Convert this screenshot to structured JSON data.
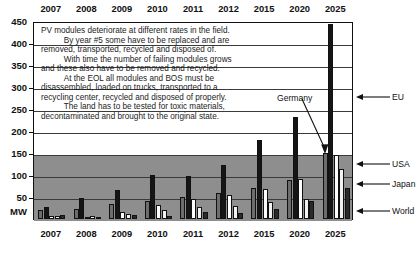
{
  "chart_data": {
    "type": "bar",
    "title": "",
    "xlabel": "",
    "ylabel": "MW",
    "ylim": [
      0,
      450
    ],
    "ytick_values": [
      450,
      400,
      350,
      300,
      250,
      200,
      150,
      100,
      50
    ],
    "ytick_labels": [
      "450",
      "400",
      "350",
      "300",
      "250",
      "200",
      "150",
      "100",
      "50"
    ],
    "origin_label": "MW",
    "grid": "horizontal gridlines at 50 MW intervals; shaded gray band from 0 to 150 MW",
    "legend_position": "right side with arrows pointing to 2025 bars; 'Germany' callout with arrow",
    "categories": [
      "2007",
      "2008",
      "2009",
      "2010",
      "2011",
      "2012",
      "2015",
      "2020",
      "2025"
    ],
    "series": [
      {
        "name": "Germany",
        "color": "#6d6d6d",
        "values": [
          20,
          22,
          35,
          42,
          50,
          60,
          70,
          88,
          150
        ]
      },
      {
        "name": "EU",
        "color": "#151515",
        "values": [
          27,
          48,
          65,
          100,
          98,
          123,
          179,
          231,
          443
        ]
      },
      {
        "name": "USA",
        "color": "#fdfdfd",
        "values": [
          6,
          5,
          16,
          32,
          45,
          55,
          69,
          90,
          145
        ]
      },
      {
        "name": "Japan",
        "color": "#f2f2f2",
        "values": [
          7,
          6,
          11,
          20,
          27,
          30,
          38,
          45,
          113
        ]
      },
      {
        "name": "World",
        "color": "#2a2a2a",
        "values": [
          8,
          3,
          8,
          7,
          15,
          13,
          22,
          40,
          70
        ]
      }
    ]
  },
  "axis": {
    "top_years": [
      "2007",
      "2008",
      "2009",
      "2010",
      "2011",
      "2012",
      "2015",
      "2020",
      "2025"
    ],
    "bottom_years": [
      "2007",
      "2008",
      "2009",
      "2010",
      "2011",
      "2012",
      "2015",
      "2020",
      "2025"
    ]
  },
  "note": {
    "text": "PV modules deteriorate at different rates in the field.\n          By year #5 some have to be replaced and are\nremoved, transported, recycled and disposed of.\n          With time the number of failing modules grows\nand these also have to be removed and recycled.\n          At the EOL all modules and BOS must be\ndisassembled, loaded on trucks, transported to a\nrecycling center, recycled and disposed of properly.\n          The land has to be tested for toxic materials,\ndecontaminated and brought to the original state."
  },
  "annotations": {
    "germany": "Germany",
    "right_labels": [
      {
        "label": "EU",
        "y": 97
      },
      {
        "label": "USA",
        "y": 164
      },
      {
        "label": "Japan",
        "y": 184
      },
      {
        "label": "World",
        "y": 211
      }
    ]
  },
  "colors": {
    "band": "#8e8e8e",
    "grid": "#3a3a3a",
    "frame": "#111111",
    "background": "#ffffff"
  }
}
